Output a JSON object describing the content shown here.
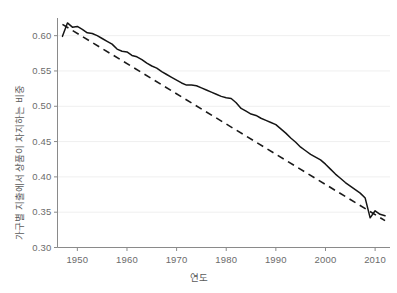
{
  "chart_data": {
    "type": "line",
    "title": "",
    "xlabel": "연도",
    "ylabel": "가구별 지출에서 상품이 차지하는 비중",
    "xlim": [
      1946,
      2013
    ],
    "ylim": [
      0.3,
      0.625
    ],
    "xticks": [
      1950,
      1960,
      1970,
      1980,
      1990,
      2000,
      2010
    ],
    "xtick_labels": [
      "1950",
      "1960",
      "1970",
      "1980",
      "1990",
      "2000",
      "2010"
    ],
    "yticks": [
      0.3,
      0.35,
      0.4,
      0.45,
      0.5,
      0.55,
      0.6
    ],
    "ytick_labels": [
      "0.30",
      "0.35",
      "0.40",
      "0.45",
      "0.50",
      "0.55",
      "0.60"
    ],
    "grid": "horizontal-only",
    "grid_color": "#efefef",
    "legend": "none",
    "series": [
      {
        "name": "실제 비중",
        "style": "solid",
        "color": "#1a1a1a",
        "x": [
          1947,
          1948,
          1949,
          1950,
          1951,
          1952,
          1953,
          1954,
          1955,
          1956,
          1957,
          1958,
          1959,
          1960,
          1961,
          1962,
          1963,
          1964,
          1965,
          1966,
          1967,
          1968,
          1969,
          1970,
          1971,
          1972,
          1973,
          1974,
          1975,
          1976,
          1977,
          1978,
          1979,
          1980,
          1981,
          1982,
          1983,
          1984,
          1985,
          1986,
          1987,
          1988,
          1989,
          1990,
          1991,
          1992,
          1993,
          1994,
          1995,
          1996,
          1997,
          1998,
          1999,
          2000,
          2001,
          2002,
          2003,
          2004,
          2005,
          2006,
          2007,
          2008,
          2009,
          2010,
          2011,
          2012
        ],
        "values": [
          0.599,
          0.618,
          0.612,
          0.613,
          0.609,
          0.604,
          0.603,
          0.6,
          0.596,
          0.592,
          0.588,
          0.581,
          0.578,
          0.577,
          0.572,
          0.57,
          0.566,
          0.561,
          0.557,
          0.554,
          0.549,
          0.545,
          0.541,
          0.537,
          0.533,
          0.53,
          0.53,
          0.529,
          0.526,
          0.523,
          0.52,
          0.517,
          0.514,
          0.512,
          0.511,
          0.505,
          0.497,
          0.493,
          0.489,
          0.487,
          0.483,
          0.48,
          0.477,
          0.474,
          0.468,
          0.462,
          0.455,
          0.449,
          0.442,
          0.437,
          0.432,
          0.428,
          0.424,
          0.418,
          0.411,
          0.404,
          0.398,
          0.392,
          0.387,
          0.382,
          0.377,
          0.37,
          0.342,
          0.352,
          0.347,
          0.345
        ]
      },
      {
        "name": "추세선",
        "style": "dashed",
        "color": "#1a1a1a",
        "x": [
          1947,
          2012
        ],
        "values": [
          0.616,
          0.338
        ]
      }
    ]
  },
  "axes": {
    "y_axis_title": "가구별 지출에서 상품이 차지하는 비중",
    "x_axis_title": "연도"
  }
}
